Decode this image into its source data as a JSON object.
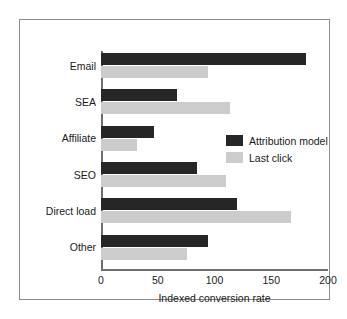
{
  "chart_data": {
    "type": "bar",
    "orientation": "horizontal",
    "title": "",
    "xlabel": "Indexed conversion rate",
    "ylabel": "",
    "xlim": [
      0,
      200
    ],
    "xticks": [
      0,
      50,
      100,
      150,
      200
    ],
    "xtick_labels": [
      "0",
      "50",
      "100",
      "150",
      "200"
    ],
    "grid": false,
    "legend_position": "center-right",
    "categories": [
      "Email",
      "SEA",
      "Affiliate",
      "SEO",
      "Direct load",
      "Other"
    ],
    "series": [
      {
        "name": "Attribution model",
        "color": "#262626",
        "values": [
          181,
          67,
          47,
          85,
          120,
          94
        ]
      },
      {
        "name": "Last click",
        "color": "#cccccc",
        "values": [
          94,
          114,
          32,
          110,
          167,
          76
        ]
      }
    ]
  },
  "legend": {
    "items": [
      {
        "label": "Attribution model",
        "swatch": "dark"
      },
      {
        "label": "Last click",
        "swatch": "light"
      }
    ]
  },
  "colors": {
    "attribution_model": "#262626",
    "last_click": "#cccccc",
    "axis": "#6e6e6e",
    "frame": "#8c8c8c",
    "text": "#1a1a1a",
    "background": "#ffffff"
  }
}
